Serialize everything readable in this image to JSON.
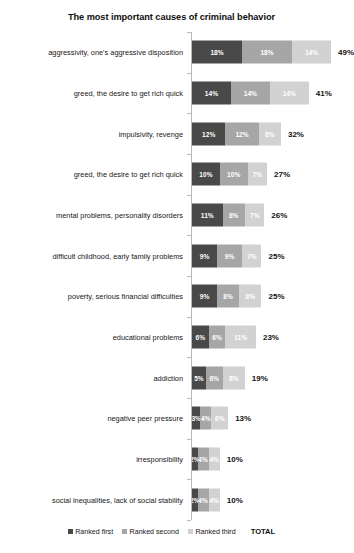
{
  "chart_data": {
    "type": "bar",
    "title": "The most important causes of criminal behavior",
    "xlabel": "",
    "ylabel": "",
    "orientation": "horizontal",
    "stacked": true,
    "grid": false,
    "legend_position": "bottom",
    "total_label": "TOTAL",
    "xlim": [
      0,
      50
    ],
    "categories": [
      "aggressivity, one's aggressive disposition",
      "greed, the desire to get rich quick",
      "impulsivity, revenge",
      "greed, the desire to get rich quick",
      "mental problems, personality disorders",
      "difficult childhood, early family problems",
      "poverty, serious financial difficulties",
      "educational problems",
      "addiction",
      "negative peer pressure",
      "irresponsibility",
      "social inequalities, lack of social stability"
    ],
    "series": [
      {
        "name": "Ranked first",
        "color": "#494949",
        "values": [
          18,
          14,
          12,
          10,
          11,
          9,
          9,
          6,
          5,
          3,
          2,
          2
        ],
        "labels": [
          "18%",
          "14%",
          "12%",
          "10%",
          "11%",
          "9%",
          "9%",
          "6%",
          "5%",
          "3%",
          "2%",
          "2%"
        ]
      },
      {
        "name": "Ranked second",
        "color": "#a6a6a6",
        "values": [
          18,
          14,
          12,
          10,
          8,
          9,
          8,
          6,
          6,
          4,
          4,
          4
        ],
        "labels": [
          "18%",
          "14%",
          "12%",
          "10%",
          "8%",
          "9%",
          "8%",
          "6%",
          "6%",
          "4%",
          "4%",
          "4%"
        ]
      },
      {
        "name": "Ranked third",
        "color": "#d2d2d2",
        "values": [
          14,
          14,
          8,
          7,
          7,
          7,
          8,
          11,
          8,
          6,
          4,
          4
        ],
        "labels": [
          "14%",
          "14%",
          "8%",
          "7%",
          "7%",
          "7%",
          "8%",
          "11%",
          "8%",
          "6%",
          "4%",
          "4%"
        ]
      }
    ],
    "totals": [
      49,
      41,
      32,
      27,
      26,
      25,
      25,
      23,
      19,
      13,
      10,
      10
    ],
    "total_labels": [
      "49%",
      "41%",
      "32%",
      "27%",
      "26%",
      "25%",
      "25%",
      "23%",
      "19%",
      "13%",
      "10%",
      "10%"
    ]
  },
  "legend": {
    "items": [
      {
        "label": "Ranked first",
        "color": "#494949"
      },
      {
        "label": "Ranked second",
        "color": "#a6a6a6"
      },
      {
        "label": "Ranked third",
        "color": "#d2d2d2"
      }
    ],
    "total": "TOTAL"
  }
}
